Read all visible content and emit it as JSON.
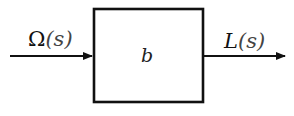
{
  "diagram": {
    "type": "block-diagram",
    "input": {
      "symbol": "Ω",
      "arg": "(s)",
      "label": "Ω(s)"
    },
    "block": {
      "label": "b"
    },
    "output": {
      "symbol": "L",
      "arg": "(s)",
      "label": "L(s)"
    },
    "colors": {
      "stroke": "#111111",
      "background": "#ffffff"
    }
  }
}
